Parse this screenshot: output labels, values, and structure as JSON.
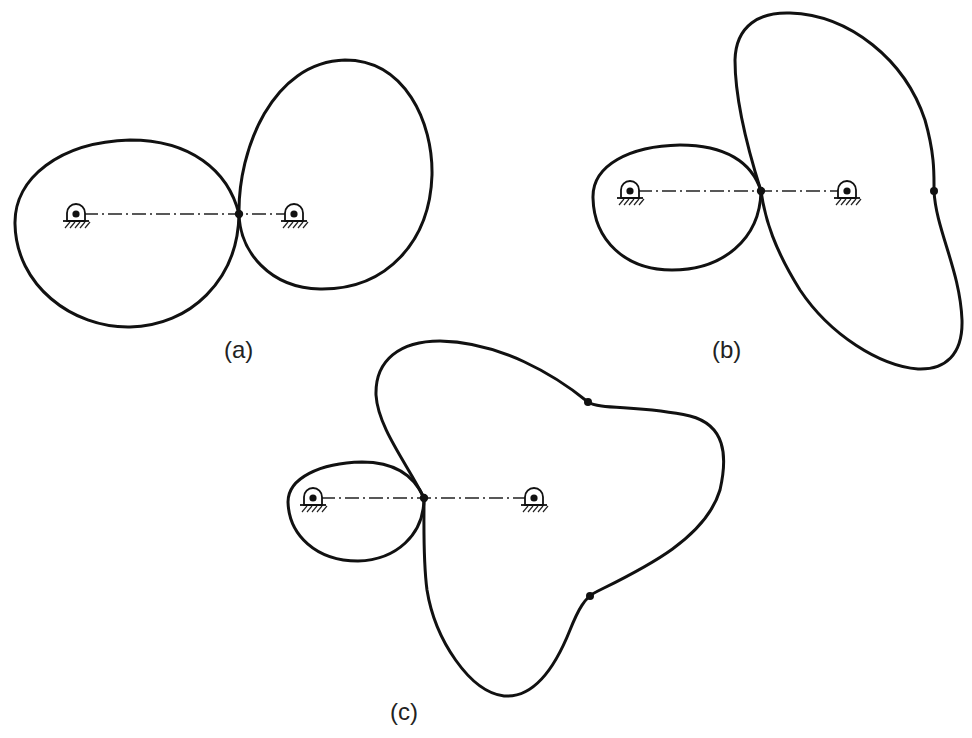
{
  "figure": {
    "panels": [
      {
        "id": "a",
        "label": "(a)",
        "caption_label": "(a)"
      },
      {
        "id": "b",
        "label": "(b)",
        "caption_label": "(b)"
      },
      {
        "id": "c",
        "label": "(c)",
        "caption_label": "(c)"
      }
    ]
  },
  "colors": {
    "stroke": "#111111",
    "background": "#ffffff"
  },
  "icons": {
    "pivot": "fixed-pivot-bearing-icon",
    "contact": "contact-point-dot"
  }
}
